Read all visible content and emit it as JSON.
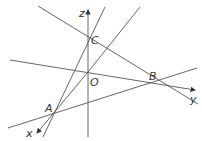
{
  "diagram": {
    "type": "3d-coordinate-geometry",
    "colors": {
      "line": "#555555",
      "text": "#333333",
      "background": "#ffffff"
    },
    "axes": {
      "x": {
        "label": "x"
      },
      "y": {
        "label": "y"
      },
      "z": {
        "label": "z"
      }
    },
    "points": {
      "O": {
        "label": "O"
      },
      "A": {
        "label": "A"
      },
      "B": {
        "label": "B"
      },
      "C": {
        "label": "C"
      }
    }
  }
}
